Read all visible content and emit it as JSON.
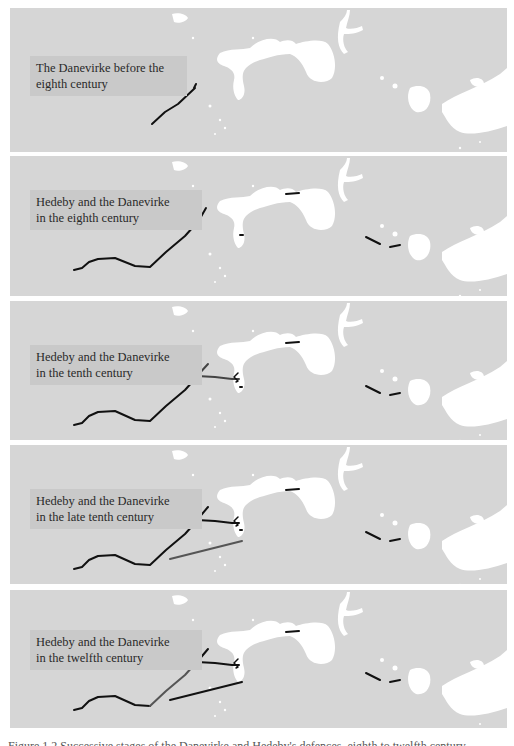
{
  "colors": {
    "land": "#d6d6d6",
    "water": "#ffffff",
    "label_bg": "#c9c9c9",
    "wall_black": "#111111",
    "wall_grey": "#555555"
  },
  "panels": [
    {
      "top": 8,
      "height": 144,
      "label_line1": "The Danevirke before the",
      "label_line2": "eighth century",
      "label_pos": {
        "left": 20,
        "top": 48,
        "width": 145
      },
      "lines": [
        {
          "pts": "142,116 155,104 168,96 185,80 184,80 186,76",
          "color": "#111111",
          "w": 2
        }
      ]
    },
    {
      "top": 156,
      "height": 140,
      "label_line1": "Hedeby and the Danevirke",
      "label_line2": "in the eighth century",
      "label_pos": {
        "left": 20,
        "top": 34,
        "width": 160
      },
      "lines": [
        {
          "pts": "64,114 72,112 79,106 88,103 105,102 125,110 140,111 156,96 175,80 184,70",
          "color": "#111111",
          "w": 2
        },
        {
          "pts": "188,66 196,52",
          "color": "#111111",
          "w": 2
        },
        {
          "pts": "230,79 233,79",
          "color": "#111111",
          "w": 2
        },
        {
          "pts": "276,38 289,37",
          "color": "#111111",
          "w": 2
        },
        {
          "pts": "356,81 370,88",
          "color": "#111111",
          "w": 2
        },
        {
          "pts": "380,91 390,89",
          "color": "#111111",
          "w": 2
        }
      ]
    },
    {
      "top": 301,
      "height": 139,
      "label_line1": "Hedeby and the Danevirke",
      "label_line2": "in the tenth century",
      "label_pos": {
        "left": 20,
        "top": 44,
        "width": 160
      },
      "lines": [
        {
          "pts": "64,124 72,122 79,115 88,111 105,110 125,119 140,120 156,105 175,89 184,79",
          "color": "#111111",
          "w": 2
        },
        {
          "pts": "198,63 187,75 205,76 222,78 229,78",
          "color": "#444444",
          "w": 2
        },
        {
          "pts": "228,72 224,76 228,80 226,81",
          "color": "#111111",
          "w": 1.5
        },
        {
          "pts": "230,86 232,86",
          "color": "#111111",
          "w": 2
        },
        {
          "pts": "276,42 289,41",
          "color": "#111111",
          "w": 2
        },
        {
          "pts": "356,85 370,92",
          "color": "#111111",
          "w": 2
        },
        {
          "pts": "380,94 390,92",
          "color": "#111111",
          "w": 2
        }
      ]
    },
    {
      "top": 445,
      "height": 139,
      "label_line1": "Hedeby and the Danevirke",
      "label_line2": "in the late tenth century",
      "label_pos": {
        "left": 20,
        "top": 44,
        "width": 160
      },
      "lines": [
        {
          "pts": "64,124 72,122 79,115 88,111 105,110 125,119 140,120 156,105 175,89 184,79",
          "color": "#111111",
          "w": 2
        },
        {
          "pts": "198,62 187,75 205,76 222,78 229,78",
          "color": "#111111",
          "w": 2
        },
        {
          "pts": "228,72 224,76 228,80 226,81",
          "color": "#111111",
          "w": 1.5
        },
        {
          "pts": "230,85 232,85",
          "color": "#111111",
          "w": 2
        },
        {
          "pts": "160,114 232,96",
          "color": "#555555",
          "w": 2
        },
        {
          "pts": "276,45 289,44",
          "color": "#111111",
          "w": 2
        },
        {
          "pts": "356,87 370,94",
          "color": "#111111",
          "w": 2
        },
        {
          "pts": "380,96 390,94",
          "color": "#111111",
          "w": 2
        }
      ]
    },
    {
      "top": 590,
      "height": 138,
      "label_line1": "Hedeby and the Danevirke",
      "label_line2": "in the twelfth century",
      "label_pos": {
        "left": 20,
        "top": 40,
        "width": 160
      },
      "lines": [
        {
          "pts": "64,120 72,118 79,111 88,107 105,106 125,115 140,116",
          "color": "#111111",
          "w": 2
        },
        {
          "pts": "140,116 156,101 175,85 184,75",
          "color": "#555555",
          "w": 2
        },
        {
          "pts": "198,59 187,72 205,73 222,75 229,75",
          "color": "#111111",
          "w": 2
        },
        {
          "pts": "228,69 224,73 228,77 226,78",
          "color": "#111111",
          "w": 1.5
        },
        {
          "pts": "160,110 232,92",
          "color": "#111111",
          "w": 2
        },
        {
          "pts": "276,42 289,41",
          "color": "#111111",
          "w": 2
        },
        {
          "pts": "356,83 370,90",
          "color": "#111111",
          "w": 2
        },
        {
          "pts": "380,92 390,90",
          "color": "#111111",
          "w": 2
        }
      ]
    }
  ],
  "caption": "Figure 1.2  Successive stages of the Danevirke and Hedeby's defences, eighth to twelfth century"
}
